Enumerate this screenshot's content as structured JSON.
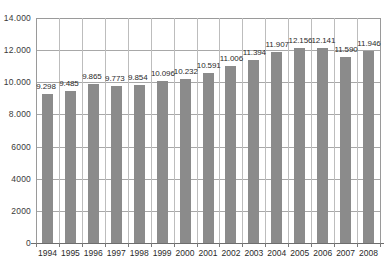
{
  "chart_data": {
    "type": "bar",
    "title": "",
    "subtitle": "",
    "xlabel": "",
    "ylabel": "",
    "categories": [
      "1994",
      "1995",
      "1996",
      "1997",
      "1998",
      "1999",
      "2000",
      "2001",
      "2002",
      "2003",
      "2004",
      "2005",
      "2006",
      "2007",
      "2008"
    ],
    "values": [
      9298,
      9485,
      9865,
      9773,
      9854,
      10096,
      10232,
      10591,
      11006,
      11394,
      11907,
      12156,
      12141,
      11590,
      11946
    ],
    "value_labels": [
      "9.298",
      "9.485",
      "9.865",
      "9.773",
      "9.854",
      "10.096",
      "10.232",
      "10.591",
      "11.006",
      "11.394",
      "11.907",
      "12.156",
      "12.141",
      "11.590",
      "11.946"
    ],
    "ylim": [
      0,
      14000
    ],
    "ytick_values": [
      14000,
      12000,
      10000,
      8000,
      6000,
      4000,
      2000,
      0
    ],
    "ytick_labels": [
      "14.000",
      "12.000",
      "10.000",
      "8.000",
      "6000",
      "4000",
      "2000",
      "0"
    ],
    "grid": "horizontal-and-vertical",
    "legend": "none",
    "legend_position": "none",
    "series_name": "",
    "bar_color": "#8b8b8b",
    "grid_color": "#bdbdbd",
    "axis_color": "#6d6d6d",
    "text_color": "#2b2b2b",
    "background_color": "#ffffff",
    "data_labels_shown": true
  }
}
